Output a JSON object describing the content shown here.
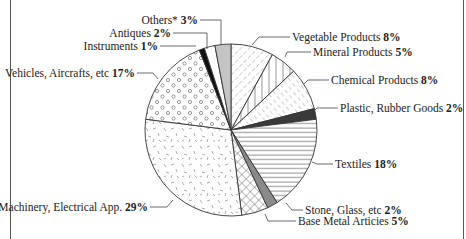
{
  "chart_data": {
    "type": "pie",
    "title": "",
    "start_angle_deg": 0,
    "direction": "clockwise",
    "slices": [
      {
        "label": "Vegetable Products",
        "value": 8,
        "pattern": "diag-dash",
        "fill": "#ffffff"
      },
      {
        "label": "Mineral Products",
        "value": 5,
        "pattern": "vertical",
        "fill": "#ffffff"
      },
      {
        "label": "Chemical Products",
        "value": 8,
        "pattern": "diag-dash2",
        "fill": "#ffffff"
      },
      {
        "label": "Plastic, Rubber Goods",
        "value": 2,
        "pattern": "solid",
        "fill": "#3a3a3a"
      },
      {
        "label": "Textiles",
        "value": 18,
        "pattern": "horizontal",
        "fill": "#ffffff"
      },
      {
        "label": "Stone, Glass, etc",
        "value": 2,
        "pattern": "solid",
        "fill": "#8a8a8a"
      },
      {
        "label": "Base Metal Articies",
        "value": 5,
        "pattern": "crosshatch",
        "fill": "#ffffff"
      },
      {
        "label": "Machinery, Electrical App.",
        "value": 29,
        "pattern": "random-dash",
        "fill": "#ffffff"
      },
      {
        "label": "Vehicles, Aircrafts, etc",
        "value": 17,
        "pattern": "circles",
        "fill": "#ffffff"
      },
      {
        "label": "Instruments",
        "value": 1,
        "pattern": "solid",
        "fill": "#111111"
      },
      {
        "label": "Antiques",
        "value": 2,
        "pattern": "blank",
        "fill": "#ffffff"
      },
      {
        "label": "Others*",
        "value": 3,
        "pattern": "solid",
        "fill": "#c4c4c4"
      }
    ],
    "labels": [
      {
        "name": "Vegetable Products",
        "pct": "8%"
      },
      {
        "name": "Mineral Products",
        "pct": "5%"
      },
      {
        "name": "Chemical Products",
        "pct": "8%"
      },
      {
        "name": "Plastic, Rubber Goods",
        "pct": "2%"
      },
      {
        "name": "Textiles",
        "pct": "18%"
      },
      {
        "name": "Stone, Glass, etc",
        "pct": "2%"
      },
      {
        "name": "Base Metal Articies",
        "pct": "5%"
      },
      {
        "name": "Machinery, Electrical App.",
        "pct": "29%"
      },
      {
        "name": "Vehicles, Aircrafts, etc",
        "pct": "17%"
      },
      {
        "name": "Instruments",
        "pct": "1%"
      },
      {
        "name": "Antiques",
        "pct": "2%"
      },
      {
        "name": "Others*",
        "pct": "3%"
      }
    ],
    "legend": "none (leader-line labels)",
    "xlabel": "",
    "ylabel": ""
  }
}
